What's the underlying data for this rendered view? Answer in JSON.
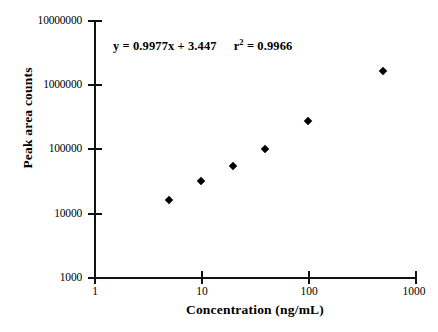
{
  "chart_data": {
    "type": "scatter",
    "title": "",
    "xlabel": "Concentration (ng/mL)",
    "ylabel": "Peak area counts",
    "xscale": "log",
    "yscale": "log",
    "xlim": [
      1,
      1000
    ],
    "ylim": [
      1000,
      10000000
    ],
    "grid": false,
    "legend": null,
    "xticks": [
      1,
      10,
      100,
      1000
    ],
    "xticklabels": [
      "1",
      "10",
      "100",
      "1000"
    ],
    "yticks": [
      1000,
      10000,
      100000,
      1000000,
      10000000
    ],
    "yticklabels": [
      "1000",
      "10000",
      "100000",
      "1000000",
      "10000000"
    ],
    "marker": "diamond",
    "marker_color": "#000000",
    "x": [
      5,
      10,
      20,
      40,
      100,
      500
    ],
    "y": [
      15600,
      31000,
      54000,
      100000,
      265000,
      1600000
    ],
    "points": [
      {
        "x": 5,
        "y": 15600
      },
      {
        "x": 10,
        "y": 31000
      },
      {
        "x": 20,
        "y": 54000
      },
      {
        "x": 40,
        "y": 100000
      },
      {
        "x": 100,
        "y": 265000
      },
      {
        "x": 500,
        "y": 1600000
      }
    ],
    "annotations": [
      {
        "name": "regression-equation",
        "equation": "y = 0.9977x + 3.447",
        "slope": 0.9977,
        "intercept": 3.447,
        "r_squared_label": "r",
        "r_squared_exponent": "2",
        "r_squared_eq": "= 0.9966",
        "r_squared": 0.9966
      }
    ]
  },
  "axes": {
    "x_title": "Concentration (ng/mL)",
    "y_title": "Peak area counts",
    "x_tick_labels": [
      "1",
      "10",
      "100",
      "1000"
    ],
    "y_tick_labels": [
      "1000",
      "10000",
      "100000",
      "1000000",
      "10000000"
    ]
  },
  "annotation": {
    "equation": "y = 0.9977x + 3.447",
    "r_label": "r",
    "r_sup": "2",
    "r_value": "= 0.9966"
  },
  "colors": {
    "axis": "#111111",
    "marker": "#000000",
    "background": "#ffffff",
    "text": "#000000"
  }
}
